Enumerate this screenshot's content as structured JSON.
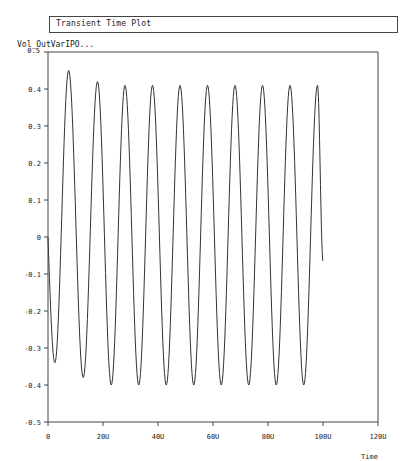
{
  "window": {
    "title": "Transient Time Plot"
  },
  "chart_data": {
    "type": "line",
    "title": "Transient Time Plot",
    "xlabel": "Time",
    "ylabel": "Vol_OutVarIPO...",
    "xlim": [
      0,
      120
    ],
    "ylim": [
      -0.5,
      0.5
    ],
    "x_unit": "U",
    "x_ticks": [
      "0",
      "20U",
      "40U",
      "60U",
      "80U",
      "100U",
      "120U"
    ],
    "x_tick_values": [
      0,
      20,
      40,
      60,
      80,
      100,
      120
    ],
    "y_ticks": [
      "0.5",
      "0.4",
      "0.3",
      "0.2",
      "0.1",
      "0",
      "-0.1",
      "-0.2",
      "-0.3",
      "-0.4",
      "-0.5"
    ],
    "y_tick_values": [
      0.5,
      0.4,
      0.3,
      0.2,
      0.1,
      0,
      -0.1,
      -0.2,
      -0.3,
      -0.4,
      -0.5
    ],
    "grid": false,
    "legend": null,
    "series": [
      {
        "name": "Vol_OutVarIPO...",
        "description": "Damped-start sinusoid, period ~10U, settling amplitude ~0.41",
        "peaks": [
          {
            "x": 7.5,
            "y": 0.45
          },
          {
            "x": 18.0,
            "y": 0.42
          },
          {
            "x": 28.0,
            "y": 0.41
          },
          {
            "x": 38.0,
            "y": 0.41
          },
          {
            "x": 48.0,
            "y": 0.41
          },
          {
            "x": 58.0,
            "y": 0.41
          },
          {
            "x": 68.0,
            "y": 0.41
          },
          {
            "x": 78.0,
            "y": 0.41
          },
          {
            "x": 88.0,
            "y": 0.41
          },
          {
            "x": 98.0,
            "y": 0.41
          }
        ],
        "troughs": [
          {
            "x": 2.5,
            "y": -0.34
          },
          {
            "x": 12.8,
            "y": -0.38
          },
          {
            "x": 23.0,
            "y": -0.4
          },
          {
            "x": 33.0,
            "y": -0.4
          },
          {
            "x": 43.0,
            "y": -0.4
          },
          {
            "x": 53.0,
            "y": -0.4
          },
          {
            "x": 63.0,
            "y": -0.4
          },
          {
            "x": 73.0,
            "y": -0.4
          },
          {
            "x": 83.0,
            "y": -0.4
          },
          {
            "x": 93.0,
            "y": -0.4
          }
        ],
        "start": {
          "x": 0,
          "y": 0.0
        },
        "end": {
          "x": 100,
          "y": -0.065
        },
        "color": "#333333"
      }
    ]
  }
}
